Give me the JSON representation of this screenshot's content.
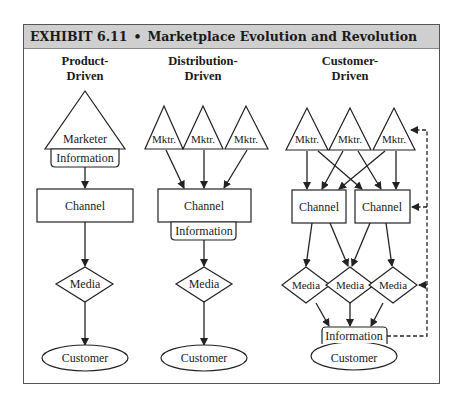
{
  "exhibit": {
    "number": "EXHIBIT 6.11",
    "separator": "•",
    "title": "Marketplace Evolution and Revolution"
  },
  "columns": {
    "product": {
      "heading_line1": "Product-",
      "heading_line2": "Driven",
      "marketer": "Marketer",
      "information": "Information",
      "channel": "Channel",
      "media": "Media",
      "customer": "Customer"
    },
    "distribution": {
      "heading_line1": "Distribution-",
      "heading_line2": "Driven",
      "marketers": [
        "Mktr.",
        "Mktr.",
        "Mktr."
      ],
      "channel": "Channel",
      "information": "Information",
      "media": "Media",
      "customer": "Customer"
    },
    "customer": {
      "heading_line1": "Customer-",
      "heading_line2": "Driven",
      "marketers": [
        "Mktr.",
        "Mktr.",
        "Mktr."
      ],
      "channels": [
        "Channel",
        "Channel"
      ],
      "media": [
        "Media",
        "Media",
        "Media"
      ],
      "information": "Information",
      "customer": "Customer",
      "feedback": "dashed"
    }
  },
  "colors": {
    "header_bg": "#cfcfcf",
    "stroke": "#222222",
    "frame": "#555555"
  }
}
